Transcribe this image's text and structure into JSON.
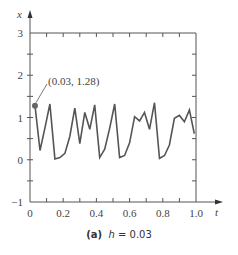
{
  "chart_data": {
    "type": "line",
    "title": "",
    "caption_label": "(a)",
    "caption_var": "h",
    "caption_value": "= 0.03",
    "xlabel": "t",
    "ylabel": "x",
    "xlim": [
      0,
      1.0
    ],
    "ylim": [
      -1,
      3
    ],
    "x_ticks": [
      "0",
      "0.2",
      "0.4",
      "0.6",
      "0.8",
      "1.0"
    ],
    "y_ticks": [
      "−1",
      "0",
      "1",
      "2",
      "3"
    ],
    "grid": false,
    "annotation": {
      "text": "(0.03, 1.28)",
      "x": 0.03,
      "y": 1.28
    },
    "series": [
      {
        "name": "x(t)",
        "color": "#555555",
        "x": [
          0.03,
          0.06,
          0.09,
          0.12,
          0.15,
          0.18,
          0.21,
          0.24,
          0.27,
          0.3,
          0.33,
          0.36,
          0.39,
          0.42,
          0.45,
          0.48,
          0.51,
          0.54,
          0.57,
          0.6,
          0.63,
          0.66,
          0.69,
          0.72,
          0.75,
          0.78,
          0.81,
          0.84,
          0.87,
          0.9,
          0.93,
          0.96,
          0.99
        ],
        "values": [
          1.28,
          0.22,
          0.75,
          1.32,
          0.02,
          0.05,
          0.15,
          0.55,
          1.22,
          0.38,
          1.12,
          0.72,
          1.3,
          0.05,
          0.25,
          0.75,
          1.32,
          0.05,
          0.1,
          0.4,
          1.02,
          0.92,
          1.12,
          0.72,
          1.35,
          0.03,
          0.1,
          0.35,
          0.98,
          1.05,
          0.9,
          1.18,
          0.62
        ]
      }
    ]
  }
}
